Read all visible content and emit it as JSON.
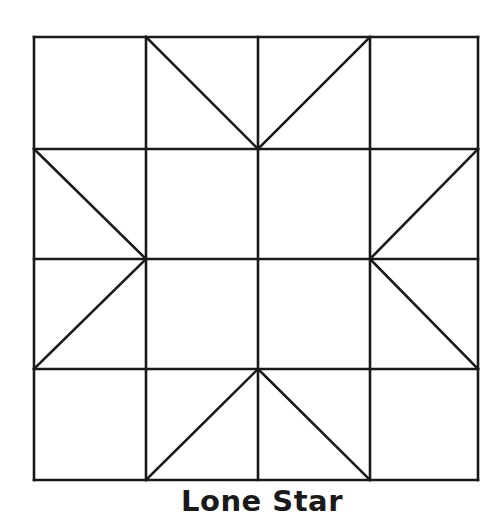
{
  "title": "Lone Star",
  "diagram": {
    "type": "quilt-block",
    "grid": {
      "rows": 4,
      "cols": 4
    },
    "stroke_color": "#1a1a1a",
    "background": "#ffffff",
    "x_lines": [
      34,
      146,
      258,
      370,
      478
    ],
    "y_lines": [
      37,
      149,
      259,
      369,
      480
    ],
    "diagonals": [
      {
        "cell": [
          0,
          1
        ],
        "from": "top-left",
        "to": "bottom-right"
      },
      {
        "cell": [
          0,
          2
        ],
        "from": "bottom-left",
        "to": "top-right"
      },
      {
        "cell": [
          1,
          0
        ],
        "from": "top-left",
        "to": "bottom-right"
      },
      {
        "cell": [
          1,
          3
        ],
        "from": "bottom-left",
        "to": "top-right"
      },
      {
        "cell": [
          2,
          0
        ],
        "from": "bottom-left",
        "to": "top-right"
      },
      {
        "cell": [
          2,
          3
        ],
        "from": "top-left",
        "to": "bottom-right"
      },
      {
        "cell": [
          3,
          1
        ],
        "from": "bottom-left",
        "to": "top-right"
      },
      {
        "cell": [
          3,
          2
        ],
        "from": "top-left",
        "to": "bottom-right"
      }
    ]
  }
}
